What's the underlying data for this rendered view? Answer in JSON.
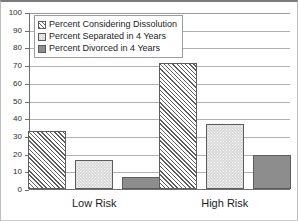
{
  "chart_data": {
    "type": "bar",
    "title": "",
    "subtitle": "",
    "xlabel": "",
    "ylabel": "",
    "categories": [
      "Low Risk",
      "High Risk"
    ],
    "series": [
      {
        "name": "Percent Considering Dissolution",
        "values": [
          33,
          71
        ]
      },
      {
        "name": "Percent Separated in 4 Years",
        "values": [
          16.5,
          36.5
        ]
      },
      {
        "name": "Percent Divorced in 4 Years",
        "values": [
          7,
          19
        ]
      }
    ],
    "ylim": [
      0,
      100
    ],
    "ytick_step": 10,
    "yticks": [
      0,
      10,
      20,
      30,
      40,
      50,
      60,
      70,
      80,
      90,
      100
    ],
    "ytick_labels": [
      "0",
      "10",
      "20",
      "30",
      "40",
      "50",
      "60",
      "70",
      "80",
      "90",
      "100"
    ],
    "grid": true,
    "grid_axis": "y",
    "legend_position": "upper-left-inside",
    "legend_entries": [
      "Percent Considering Dissolution",
      "Percent Separated in 4 Years",
      "Percent Divorced in 4 Years"
    ],
    "colors": {
      "series_0_fill": "#e9e9e9",
      "series_0_pattern": "diagonal-hatch",
      "series_1_fill": "#d8d8d8",
      "series_1_pattern": "dotted-stipple",
      "series_2_fill": "#8d8d8d",
      "series_2_pattern": "solid",
      "bar_edge": "#5d5d5d",
      "gridline": "#b0b0b0",
      "axis": "#6f6f6f",
      "text": "#1d1d1d",
      "background": "#ffffff"
    }
  }
}
